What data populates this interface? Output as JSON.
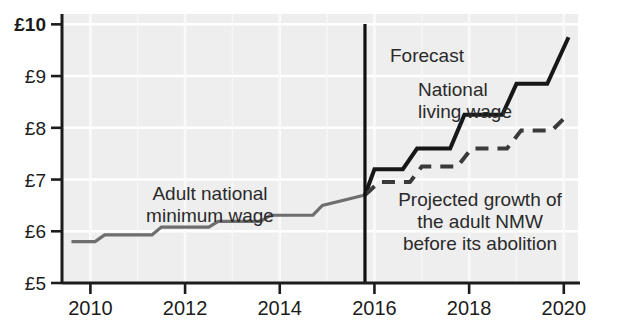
{
  "chart_data": {
    "type": "line",
    "title": "",
    "subtitle": "",
    "xlabel": "",
    "ylabel": "",
    "xlim": [
      2009.4,
      2020.3
    ],
    "ylim": [
      5,
      10.2
    ],
    "grid": true,
    "legend_position": "inline-annotations",
    "currency_prefix": "£",
    "y_ticks": [
      {
        "value": 10,
        "label": "£10",
        "bold": true
      },
      {
        "value": 9,
        "label": "£9",
        "bold": false
      },
      {
        "value": 8,
        "label": "£8",
        "bold": false
      },
      {
        "value": 7,
        "label": "£7",
        "bold": false
      },
      {
        "value": 6,
        "label": "£6",
        "bold": false
      },
      {
        "value": 5,
        "label": "£5",
        "bold": false
      }
    ],
    "x_ticks": [
      {
        "value": 2010,
        "label": "2010"
      },
      {
        "value": 2012,
        "label": "2012"
      },
      {
        "value": 2014,
        "label": "2014"
      },
      {
        "value": 2016,
        "label": "2016"
      },
      {
        "value": 2018,
        "label": "2018"
      },
      {
        "value": 2020,
        "label": "2020"
      }
    ],
    "forecast_line": {
      "value": 2015.8,
      "label": "Forecast"
    },
    "series": [
      {
        "name": "Adult national minimum wage",
        "style": "solid",
        "color": "#6e6e6e",
        "width": 3.2,
        "points": [
          [
            2009.6,
            5.8
          ],
          [
            2010.1,
            5.8
          ],
          [
            2010.3,
            5.93
          ],
          [
            2011.3,
            5.93
          ],
          [
            2011.5,
            6.08
          ],
          [
            2012.5,
            6.08
          ],
          [
            2012.7,
            6.19
          ],
          [
            2013.6,
            6.19
          ],
          [
            2013.8,
            6.31
          ],
          [
            2014.7,
            6.31
          ],
          [
            2014.9,
            6.5
          ],
          [
            2015.8,
            6.7
          ]
        ]
      },
      {
        "name": "National living wage",
        "style": "solid",
        "color": "#171717",
        "width": 4.0,
        "points": [
          [
            2015.8,
            6.7
          ],
          [
            2016.0,
            7.2
          ],
          [
            2016.6,
            7.2
          ],
          [
            2016.9,
            7.6
          ],
          [
            2017.6,
            7.6
          ],
          [
            2017.9,
            8.25
          ],
          [
            2018.7,
            8.25
          ],
          [
            2019.0,
            8.85
          ],
          [
            2019.65,
            8.85
          ],
          [
            2020.1,
            9.75
          ]
        ]
      },
      {
        "name": "Projected growth of the adult NMW before its abolition",
        "style": "dashed",
        "color": "#3a3a3a",
        "width": 4.0,
        "dash": "13,9",
        "points": [
          [
            2015.8,
            6.7
          ],
          [
            2016.1,
            6.95
          ],
          [
            2016.75,
            6.95
          ],
          [
            2017.0,
            7.25
          ],
          [
            2017.75,
            7.25
          ],
          [
            2018.05,
            7.6
          ],
          [
            2018.8,
            7.6
          ],
          [
            2019.1,
            7.95
          ],
          [
            2019.75,
            7.95
          ],
          [
            2020.1,
            8.27
          ]
        ]
      }
    ],
    "annotations": [
      {
        "id": "nmw-label",
        "lines": [
          "Adult national",
          "minimum wage"
        ],
        "x": 210,
        "y": 200,
        "anchor": "middle"
      },
      {
        "id": "forecast-label",
        "lines": [
          "Forecast"
        ],
        "x": 390,
        "y": 62,
        "anchor": "start"
      },
      {
        "id": "nlw-label",
        "lines": [
          "National",
          "living wage"
        ],
        "x": 418,
        "y": 96,
        "anchor": "start"
      },
      {
        "id": "projected-label",
        "lines": [
          "Projected growth of",
          "the adult NMW",
          "before its abolition"
        ],
        "x": 480,
        "y": 206,
        "anchor": "middle"
      }
    ],
    "colors": {
      "plot_background": "#eeeeee",
      "gridline": "#ffffff",
      "axis": "#1c1c1c",
      "nmw_line": "#6e6e6e",
      "nlw_line": "#171717",
      "projected_line": "#3a3a3a",
      "text": "#1c1c1c"
    }
  }
}
